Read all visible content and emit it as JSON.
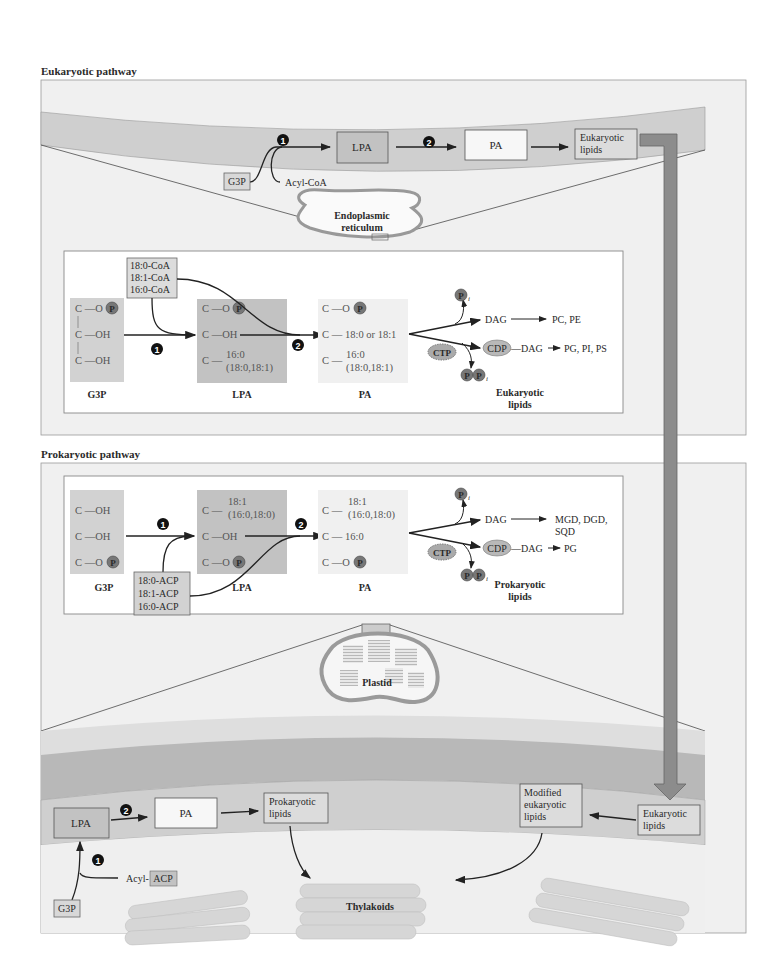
{
  "sections": {
    "eukaryotic_title": "Eukaryotic pathway",
    "prokaryotic_title": "Prokaryotic pathway"
  },
  "steps": {
    "one": "1",
    "two": "2"
  },
  "er_membrane": {
    "g3p": "G3P",
    "acyl": "Acyl-CoA",
    "lpa": "LPA",
    "pa": "PA",
    "lipids_line1": "Eukaryotic",
    "lipids_line2": "lipids",
    "organelle_line1": "Endoplasmic",
    "organelle_line2": "reticulum"
  },
  "euk_detail": {
    "acyl_donors": [
      "18:0-CoA",
      "18:1-CoA",
      "16:0-CoA"
    ],
    "g3p": {
      "rows": [
        "C —O",
        "C —OH",
        "C —OH"
      ],
      "label": "G3P"
    },
    "lpa": {
      "rows": [
        "C —O",
        "C —OH",
        "C —"
      ],
      "chain1": "16:0",
      "chain2": "(18:0,18:1)",
      "label": "LPA"
    },
    "pa": {
      "rows": [
        "C —O",
        "C —",
        "C —"
      ],
      "sn2": "18:0 or 18:1",
      "chain1": "16:0",
      "chain2": "(18:0,18:1)",
      "label": "PA"
    },
    "phosphate": "P",
    "pi": "P",
    "pi_sub": "i",
    "dag": "DAG",
    "dag_products": "PC, PE",
    "ctp": "CTP",
    "cdp": "CDP",
    "cdp_dag": "—DAG",
    "cdp_products": "PG, PI, PS",
    "ppi": "P",
    "products_line1": "Eukaryotic",
    "products_line2": "lipids"
  },
  "prok_detail": {
    "acyl_donors": [
      "18:0-ACP",
      "18:1-ACP",
      "16:0-ACP"
    ],
    "g3p": {
      "rows": [
        "C —OH",
        "C —OH",
        "C —O"
      ],
      "label": "G3P"
    },
    "lpa": {
      "rows": [
        "C —",
        "C —OH",
        "C —O"
      ],
      "chain1": "18:1",
      "chain2": "(16:0,18:0)",
      "label": "LPA"
    },
    "pa": {
      "rows": [
        "C —",
        "C —",
        "C —O"
      ],
      "sn2": "16:0",
      "chain1": "18:1",
      "chain2": "(16:0,18:0)",
      "label": "PA"
    },
    "dag": "DAG",
    "dag_products_line1": "MGD, DGD,",
    "dag_products_line2": "SQD",
    "ctp": "CTP",
    "cdp": "CDP",
    "cdp_dag": "—DAG",
    "cdp_products": "PG",
    "products_line1": "Prokaryotic",
    "products_line2": "lipids"
  },
  "plastid": {
    "label": "Plastid"
  },
  "plastid_membrane": {
    "lpa": "LPA",
    "pa": "PA",
    "prok_lipids_line1": "Prokaryotic",
    "prok_lipids_line2": "lipids",
    "modified_line1": "Modified",
    "modified_line2": "eukaryotic",
    "modified_line3": "lipids",
    "euk_lipids_line1": "Eukaryotic",
    "euk_lipids_line2": "lipids",
    "acyl": "Acyl-",
    "acyl_box": "ACP",
    "g3p": "G3P",
    "thylakoids": "Thylakoids"
  },
  "colors": {
    "membrane_band": "#cfcfcf",
    "membrane_dark": "#b4b4b4",
    "panel_bg": "#f0f0f0",
    "box_gray": "#bdbdbd",
    "transfer_arrow": "#8c8c8c"
  }
}
